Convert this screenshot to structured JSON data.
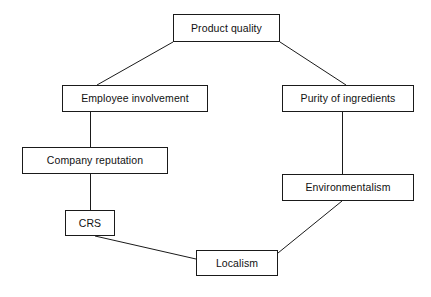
{
  "diagram": {
    "background_color": "#ffffff",
    "stroke_color": "#1a1a1a",
    "text_color": "#111111",
    "layout": "octagonal cycle",
    "nodes": [
      {
        "id": "product-quality",
        "label": "Product quality",
        "x": 173,
        "y": 14,
        "width": 107,
        "height": 28
      },
      {
        "id": "employee-involvement",
        "label": "Employee involvement",
        "x": 62,
        "y": 85,
        "width": 146,
        "height": 27
      },
      {
        "id": "purity-of-ingredients",
        "label": "Purity of ingredients",
        "x": 282,
        "y": 85,
        "width": 132,
        "height": 27
      },
      {
        "id": "company-reputation",
        "label": "Company reputation",
        "x": 22,
        "y": 147,
        "width": 146,
        "height": 27
      },
      {
        "id": "environmentalism",
        "label": "Environmentalism",
        "x": 282,
        "y": 174,
        "width": 132,
        "height": 27
      },
      {
        "id": "crs",
        "label": "CRS",
        "x": 65,
        "y": 210,
        "width": 50,
        "height": 26
      },
      {
        "id": "localism",
        "label": "Localism",
        "x": 196,
        "y": 250,
        "width": 82,
        "height": 26
      }
    ],
    "edges": [
      {
        "id": "product-quality-to-employee-involvement",
        "from": "product-quality",
        "to": "employee-involvement",
        "kind": "diagonal",
        "x1": 173,
        "y1": 42,
        "x2": 97,
        "y2": 85
      },
      {
        "id": "product-quality-to-purity-of-ingredients",
        "from": "product-quality",
        "to": "purity-of-ingredients",
        "kind": "diagonal",
        "x1": 280,
        "y1": 42,
        "x2": 346,
        "y2": 85
      },
      {
        "id": "employee-involvement-to-company-reputation",
        "from": "employee-involvement",
        "to": "company-reputation",
        "kind": "vertical",
        "x1": 90,
        "y1": 112,
        "x2": 90,
        "y2": 147
      },
      {
        "id": "purity-of-ingredients-to-environmentalism",
        "from": "purity-of-ingredients",
        "to": "environmentalism",
        "kind": "vertical",
        "x1": 342,
        "y1": 112,
        "x2": 342,
        "y2": 174
      },
      {
        "id": "company-reputation-to-crs",
        "from": "company-reputation",
        "to": "crs",
        "kind": "vertical",
        "x1": 90,
        "y1": 174,
        "x2": 90,
        "y2": 210
      },
      {
        "id": "crs-to-localism",
        "from": "crs",
        "to": "localism",
        "kind": "diagonal",
        "x1": 95,
        "y1": 236,
        "x2": 196,
        "y2": 259
      },
      {
        "id": "environmentalism-to-localism",
        "from": "environmentalism",
        "to": "localism",
        "kind": "diagonal",
        "x1": 342,
        "y1": 201,
        "x2": 278,
        "y2": 253
      }
    ]
  }
}
